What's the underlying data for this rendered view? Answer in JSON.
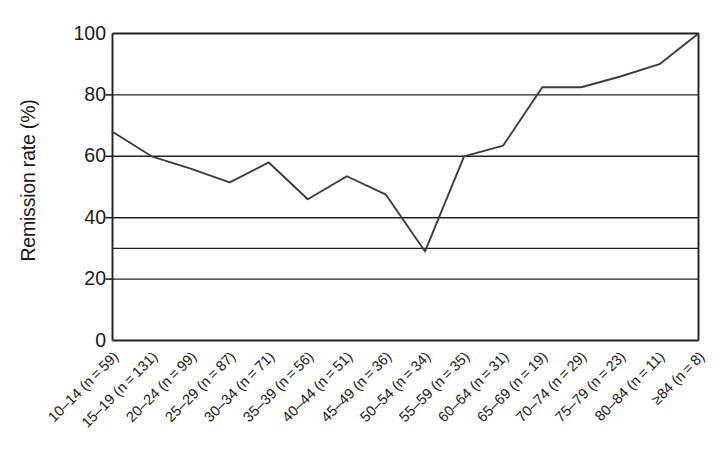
{
  "chart_data": {
    "type": "line",
    "title": "",
    "xlabel": "",
    "ylabel": "Remission rate (%)",
    "ylim": [
      0,
      100
    ],
    "yticks": [
      0,
      20,
      40,
      60,
      80,
      100
    ],
    "ytick_labels": [
      "0",
      "20",
      "40",
      "60",
      "80",
      "100"
    ],
    "gridlines": [
      20,
      30,
      40,
      60,
      80,
      100
    ],
    "grid": true,
    "legend": "none",
    "line_color": "#3c3c3c",
    "axis_color": "#222222",
    "background": "#ffffff",
    "categories": [
      "10–14 (n = 59)",
      "15–19 (n = 131)",
      "20–24 (n = 99)",
      "25–29 (n = 87)",
      "30–34 (n = 71)",
      "35–39 (n = 56)",
      "40–44 (n = 51)",
      "45–49 (n = 36)",
      "50–54 (n = 34)",
      "55–59 (n = 35)",
      "60–64 (n = 31)",
      "65–69 (n = 19)",
      "70–74 (n = 29)",
      "75–79 (n = 23)",
      "80–84 (n = 11)",
      "≥84 (n = 8)"
    ],
    "group_counts": [
      59,
      131,
      99,
      87,
      71,
      56,
      51,
      36,
      34,
      35,
      31,
      19,
      29,
      23,
      11,
      8
    ],
    "values": [
      68,
      60,
      56,
      51.5,
      58,
      46,
      53.5,
      47.5,
      29,
      60,
      63.5,
      82.5,
      82.5,
      86,
      90,
      100
    ],
    "series": [
      {
        "name": "Remission rate",
        "values": [
          68,
          60,
          56,
          51.5,
          58,
          46,
          53.5,
          47.5,
          29,
          60,
          63.5,
          82.5,
          82.5,
          86,
          90,
          100
        ]
      }
    ]
  }
}
